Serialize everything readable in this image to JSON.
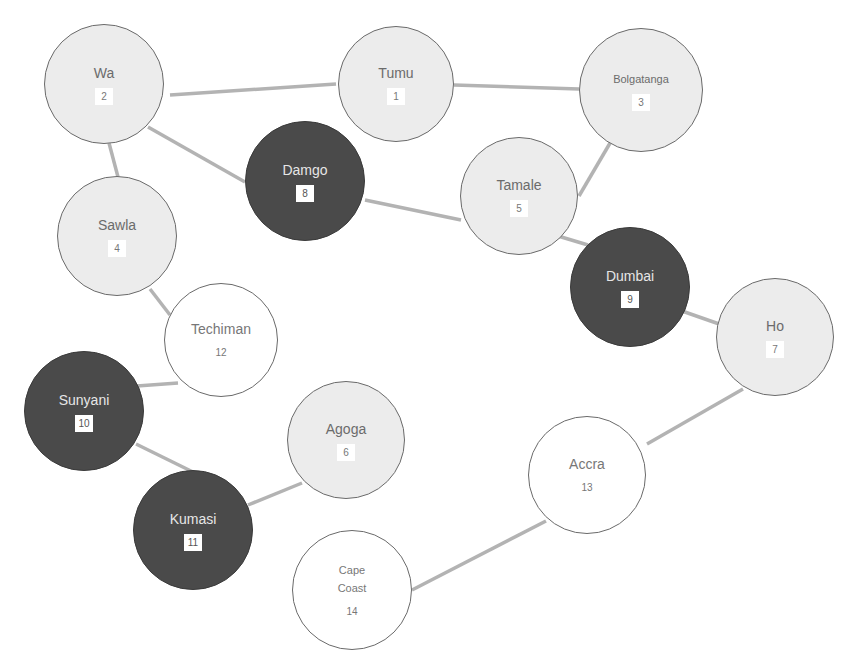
{
  "diagram": {
    "type": "graph",
    "colors": {
      "light_fill": "#ececec",
      "dark_fill": "#4a4a4a",
      "white_fill": "#ffffff",
      "edge": "#b3b3b3",
      "outline": "#6a6a6a"
    },
    "nodes": [
      {
        "id": 1,
        "name": "Tumu",
        "number": "1",
        "style": "light",
        "cx": 396,
        "cy": 84,
        "r": 58
      },
      {
        "id": 2,
        "name": "Wa",
        "number": "2",
        "style": "light",
        "cx": 104,
        "cy": 84,
        "r": 60
      },
      {
        "id": 3,
        "name": "Bolgatanga",
        "number": "3",
        "style": "light",
        "cx": 641,
        "cy": 90,
        "r": 62
      },
      {
        "id": 4,
        "name": "Sawla",
        "number": "4",
        "style": "light",
        "cx": 117,
        "cy": 236,
        "r": 60
      },
      {
        "id": 5,
        "name": "Tamale",
        "number": "5",
        "style": "light",
        "cx": 519,
        "cy": 196,
        "r": 59
      },
      {
        "id": 6,
        "name": "Agoga",
        "number": "6",
        "style": "light",
        "cx": 346,
        "cy": 440,
        "r": 59
      },
      {
        "id": 7,
        "name": "Ho",
        "number": "7",
        "style": "light",
        "cx": 775,
        "cy": 337,
        "r": 59
      },
      {
        "id": 8,
        "name": "Damgo",
        "number": "8",
        "style": "dark",
        "cx": 305,
        "cy": 181,
        "r": 60
      },
      {
        "id": 9,
        "name": "Dumbai",
        "number": "9",
        "style": "dark",
        "cx": 630,
        "cy": 287,
        "r": 60
      },
      {
        "id": 10,
        "name": "Sunyani",
        "number": "10",
        "style": "dark",
        "cx": 84,
        "cy": 411,
        "r": 60
      },
      {
        "id": 11,
        "name": "Kumasi",
        "number": "11",
        "style": "dark",
        "cx": 193,
        "cy": 530,
        "r": 60
      },
      {
        "id": 12,
        "name": "Techiman",
        "number": "12",
        "style": "white",
        "cx": 221,
        "cy": 340,
        "r": 57
      },
      {
        "id": 13,
        "name": "Accra",
        "number": "13",
        "style": "white",
        "cx": 587,
        "cy": 475,
        "r": 59
      },
      {
        "id": 14,
        "name": "Cape\nCoast",
        "number": "14",
        "style": "white",
        "cx": 352,
        "cy": 590,
        "r": 60
      }
    ],
    "edges": [
      {
        "from": 2,
        "to": 1,
        "x1": 170,
        "y1": 95,
        "x2": 336,
        "y2": 84
      },
      {
        "from": 1,
        "to": 3,
        "x1": 454,
        "y1": 85,
        "x2": 579,
        "y2": 89
      },
      {
        "from": 2,
        "to": 8,
        "x1": 148,
        "y1": 127,
        "x2": 245,
        "y2": 182
      },
      {
        "from": 2,
        "to": 4,
        "x1": 109,
        "y1": 143,
        "x2": 118,
        "y2": 177
      },
      {
        "from": 8,
        "to": 5,
        "x1": 365,
        "y1": 200,
        "x2": 461,
        "y2": 220
      },
      {
        "from": 3,
        "to": 5,
        "x1": 613,
        "y1": 138,
        "x2": 579,
        "y2": 196
      },
      {
        "from": 5,
        "to": 9,
        "x1": 558,
        "y1": 236,
        "x2": 588,
        "y2": 245
      },
      {
        "from": 4,
        "to": 12,
        "x1": 150,
        "y1": 289,
        "x2": 170,
        "y2": 315
      },
      {
        "from": 9,
        "to": 7,
        "x1": 682,
        "y1": 311,
        "x2": 722,
        "y2": 325
      },
      {
        "from": 12,
        "to": 10,
        "x1": 178,
        "y1": 383,
        "x2": 137,
        "y2": 386
      },
      {
        "from": 10,
        "to": 11,
        "x1": 136,
        "y1": 444,
        "x2": 193,
        "y2": 472
      },
      {
        "from": 6,
        "to": 11,
        "x1": 302,
        "y1": 483,
        "x2": 248,
        "y2": 505
      },
      {
        "from": 7,
        "to": 13,
        "x1": 743,
        "y1": 389,
        "x2": 647,
        "y2": 444
      },
      {
        "from": 13,
        "to": 14,
        "x1": 546,
        "y1": 521,
        "x2": 412,
        "y2": 590
      }
    ]
  }
}
